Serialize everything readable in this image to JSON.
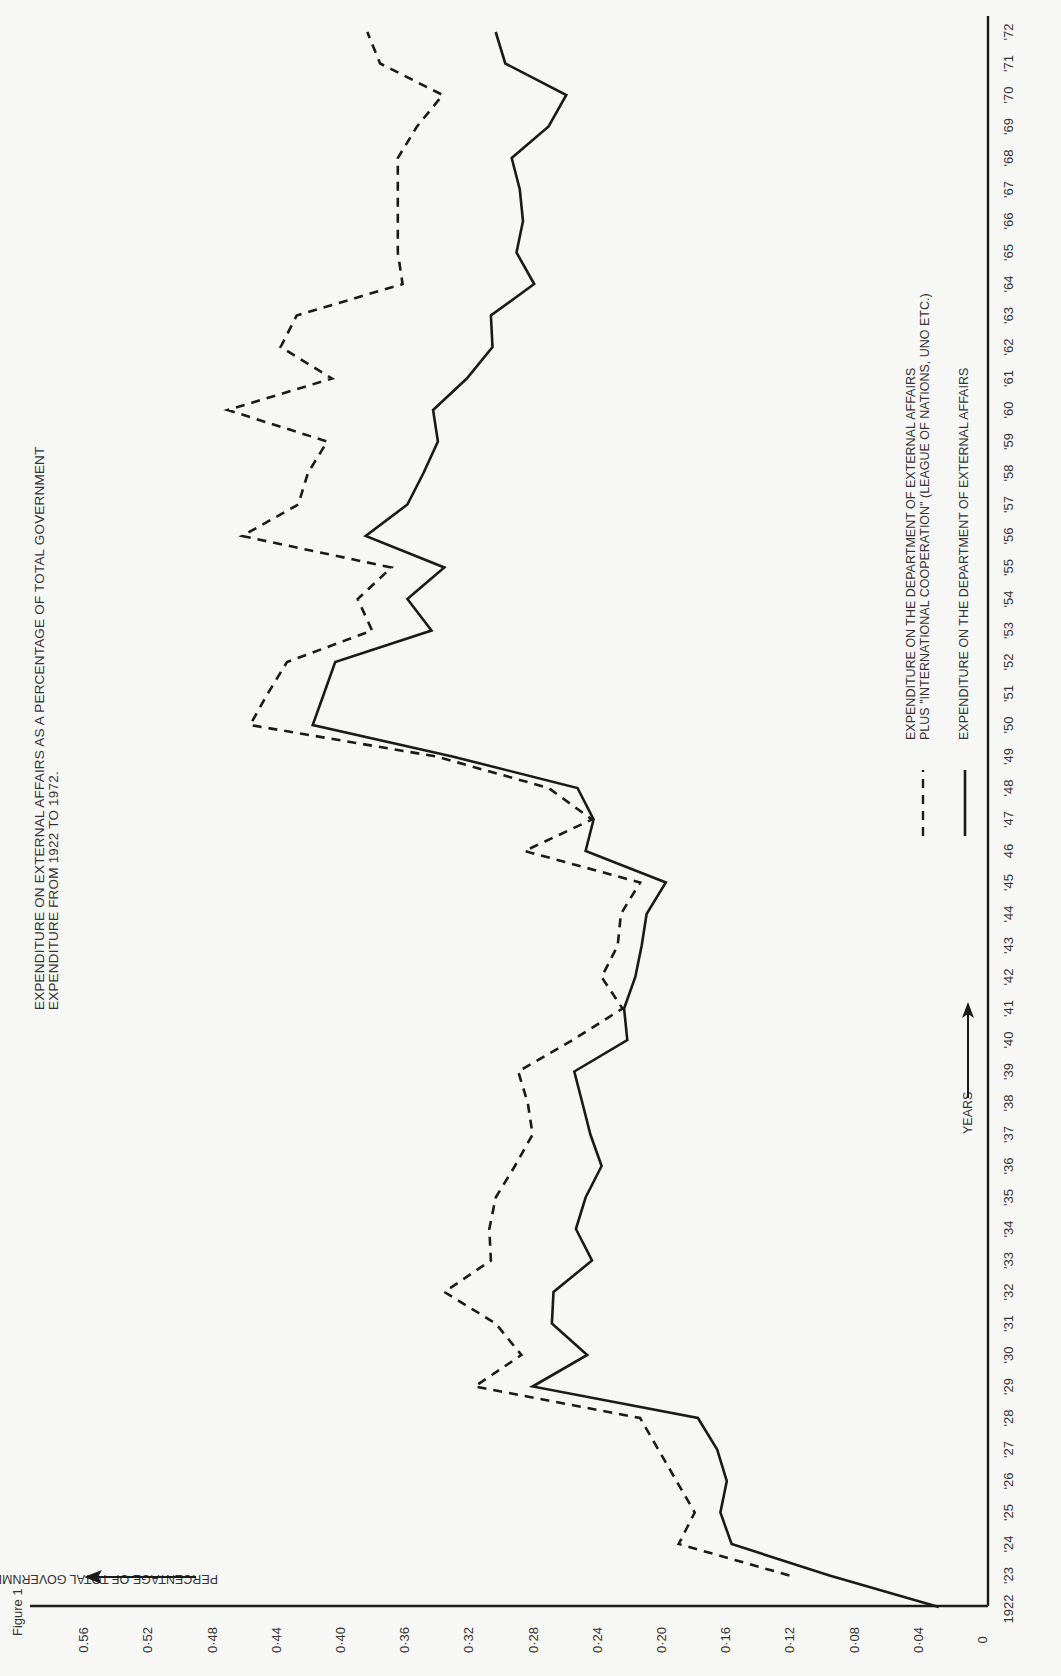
{
  "figure_label": "Figure 1",
  "title_lines": [
    "EXPENDITURE ON EXTERNAL AFFAIRS AS A PERCENTAGE OF TOTAL GOVERNMENT",
    "EXPENDITURE FROM 1922 TO 1972."
  ],
  "y_axis_label": "PERCENTAGE OF TOTAL GOVERNMENT EXPENDITURE",
  "x_axis_label": "YEARS",
  "legend": [
    {
      "style": "dashed",
      "lines": [
        "EXPENDITURE ON THE DEPARTMENT OF EXTERNAL AFFAIRS",
        "PLUS \"INTERNATIONAL COOPERATION\" (LEAGUE OF NATIONS, UNO ETC.)"
      ]
    },
    {
      "style": "solid",
      "lines": [
        "EXPENDITURE ON THE DEPARTMENT OF EXTERNAL AFFAIRS"
      ]
    }
  ],
  "chart_data": {
    "type": "line",
    "title": "EXPENDITURE ON EXTERNAL AFFAIRS AS A PERCENTAGE OF TOTAL GOVERNMENT EXPENDITURE FROM 1922 TO 1972.",
    "xlabel": "YEARS",
    "ylabel": "PERCENTAGE OF TOTAL GOVERNMENT EXPENDITURE",
    "orientation": "rotated 90° (years run bottom-to-top, values increase right-to-left)",
    "ylim": [
      0,
      0.58
    ],
    "xlim": [
      1922,
      1972
    ],
    "y_ticks": [
      "0",
      "0·04",
      "0·08",
      "0·12",
      "0·16",
      "0·20",
      "0·24",
      "0·28",
      "0·32",
      "0·36",
      "0·40",
      "0·44",
      "0·48",
      "0·52",
      "0.56"
    ],
    "y_tick_values": [
      0,
      0.04,
      0.08,
      0.12,
      0.16,
      0.2,
      0.24,
      0.28,
      0.32,
      0.36,
      0.4,
      0.44,
      0.48,
      0.52,
      0.56
    ],
    "x_ticks": [
      "1922",
      "'23",
      "'24",
      "'25",
      "'26",
      "'27",
      "'28",
      "'29",
      "'30",
      "'31",
      "'32",
      "'33",
      "'34",
      "'35",
      "'36",
      "'37",
      "'38",
      "'39",
      "'40",
      "'41",
      "'42",
      "'43",
      "'44",
      "'45",
      "46",
      "'47",
      "'48",
      "'49",
      "'50",
      "'51",
      "'52",
      "'53",
      "'54",
      "'55",
      "'56",
      "'57",
      "'58",
      "'59",
      "'60",
      "'61",
      "'62",
      "'63",
      "'64",
      "'65",
      "'66",
      "'67",
      "'68",
      "'69",
      "'70",
      "'71",
      "'72"
    ],
    "grid": false,
    "legend_position": "lower-right (rotated)",
    "series": [
      {
        "name": "EXPENDITURE ON THE DEPARTMENT OF EXTERNAL AFFAIRS PLUS \"INTERNATIONAL COOPERATION\" (LEAGUE OF NATIONS, UNO ETC.)",
        "style": "dashed",
        "x": [
          1923,
          1924,
          1925,
          1928,
          1929,
          1930,
          1931,
          1932,
          1933,
          1934,
          1935,
          1936,
          1937,
          1938,
          1939,
          1940,
          1941,
          1942,
          1943,
          1944,
          1945,
          1946,
          1947,
          1948,
          1949,
          1950,
          1951,
          1952,
          1953,
          1954,
          1955,
          1956,
          1957,
          1958,
          1959,
          1960,
          1961,
          1962,
          1963,
          1964,
          1965,
          1966,
          1967,
          1968,
          1969,
          1970,
          1971,
          1972
        ],
        "values": [
          0.12,
          0.189,
          0.179,
          0.213,
          0.316,
          0.287,
          0.303,
          0.335,
          0.306,
          0.307,
          0.303,
          0.291,
          0.28,
          0.283,
          0.289,
          0.255,
          0.224,
          0.237,
          0.227,
          0.225,
          0.213,
          0.285,
          0.243,
          0.27,
          0.34,
          0.456,
          0.445,
          0.433,
          0.38,
          0.389,
          0.368,
          0.461,
          0.426,
          0.42,
          0.408,
          0.47,
          0.405,
          0.437,
          0.427,
          0.361,
          0.364,
          0.364,
          0.364,
          0.364,
          0.352,
          0.336,
          0.375,
          0.383
        ]
      },
      {
        "name": "EXPENDITURE ON THE DEPARTMENT OF EXTERNAL AFFAIRS",
        "style": "solid",
        "x": [
          1922,
          1923,
          1924,
          1925,
          1926,
          1927,
          1928,
          1929,
          1930,
          1931,
          1932,
          1933,
          1934,
          1935,
          1936,
          1937,
          1938,
          1939,
          1940,
          1941,
          1942,
          1943,
          1944,
          1945,
          1946,
          1947,
          1948,
          1949,
          1950,
          1951,
          1952,
          1953,
          1954,
          1955,
          1956,
          1957,
          1958,
          1959,
          1960,
          1961,
          1962,
          1963,
          1964,
          1965,
          1966,
          1967,
          1968,
          1969,
          1970,
          1971,
          1972
        ],
        "values": [
          0.027,
          0.095,
          0.156,
          0.163,
          0.159,
          0.165,
          0.177,
          0.28,
          0.246,
          0.268,
          0.267,
          0.243,
          0.253,
          0.247,
          0.237,
          0.244,
          0.249,
          0.254,
          0.221,
          0.223,
          0.216,
          0.212,
          0.209,
          0.197,
          0.247,
          0.242,
          0.252,
          0.33,
          0.417,
          0.41,
          0.403,
          0.343,
          0.358,
          0.335,
          0.384,
          0.358,
          0.348,
          0.339,
          0.342,
          0.321,
          0.305,
          0.306,
          0.279,
          0.29,
          0.286,
          0.288,
          0.293,
          0.27,
          0.259,
          0.297,
          0.303
        ]
      }
    ]
  }
}
